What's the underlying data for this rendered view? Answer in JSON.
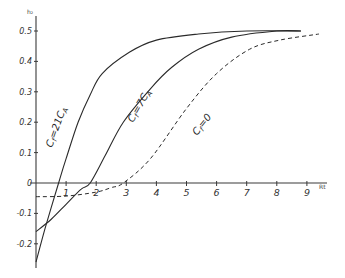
{
  "chart_data": {
    "type": "line",
    "title": "",
    "xlabel": "Rt",
    "ylabel": "h₂",
    "xlim": [
      0,
      9.5
    ],
    "ylim": [
      -0.27,
      0.55
    ],
    "grid": false,
    "x_ticks": [
      1,
      2,
      3,
      4,
      5,
      6,
      7,
      8,
      9
    ],
    "x_tick_labels": [
      "1",
      "2",
      "3",
      "4",
      "5",
      "6",
      "7",
      "8",
      "9"
    ],
    "y_ticks": [
      0.5,
      0.4,
      0.3,
      0.2,
      0.1,
      0,
      -0.1,
      -0.2
    ],
    "y_tick_labels": [
      "0.5",
      "0.4",
      "0.3",
      "0.2",
      "0.1",
      "0",
      "-0.1",
      "-0.2"
    ],
    "series": [
      {
        "name": "Cf = 21 C_A",
        "label": "Cf=21CA",
        "style": "solid",
        "x": [
          0,
          0.3,
          0.75,
          1.0,
          1.4,
          1.8,
          2.2,
          3.1,
          4.0,
          5.4,
          7.0,
          8.8
        ],
        "values": [
          -0.26,
          -0.15,
          0,
          0.08,
          0.2,
          0.29,
          0.36,
          0.43,
          0.47,
          0.49,
          0.5,
          0.5
        ]
      },
      {
        "name": "Cf = 7 C_A",
        "label": "Cf=7CA",
        "style": "solid",
        "x": [
          0,
          0.5,
          1.0,
          1.5,
          1.8,
          2.3,
          2.9,
          3.8,
          4.5,
          5.4,
          6.5,
          8.0,
          8.8
        ],
        "values": [
          -0.16,
          -0.12,
          -0.07,
          -0.02,
          0,
          0.09,
          0.2,
          0.31,
          0.38,
          0.44,
          0.48,
          0.5,
          0.5
        ]
      },
      {
        "name": "Cf = 0",
        "label": "Cf=0",
        "style": "dashed",
        "x": [
          0,
          1.0,
          2.0,
          2.5,
          2.9,
          3.8,
          5.0,
          6.0,
          7.1,
          8.1,
          9.4
        ],
        "values": [
          -0.045,
          -0.043,
          -0.03,
          -0.015,
          0,
          0.08,
          0.245,
          0.36,
          0.44,
          0.47,
          0.49
        ]
      }
    ],
    "annotations": [
      {
        "text": "Cf=21CA",
        "near_series": "Cf = 21 C_A"
      },
      {
        "text": "Cf=7CA",
        "near_series": "Cf = 7 C_A"
      },
      {
        "text": "Cf=0",
        "near_series": "Cf = 0"
      }
    ]
  },
  "labels": {
    "y_axis": "h₂",
    "x_axis": "Rt",
    "ann1_a": "C",
    "ann1_sub": "f",
    "ann1_b": "=21C",
    "ann1_sub2": "A",
    "ann2_a": "C",
    "ann2_sub": "f",
    "ann2_b": "=7C",
    "ann2_sub2": "A",
    "ann3_a": "C",
    "ann3_sub": "f",
    "ann3_b": "=0"
  }
}
